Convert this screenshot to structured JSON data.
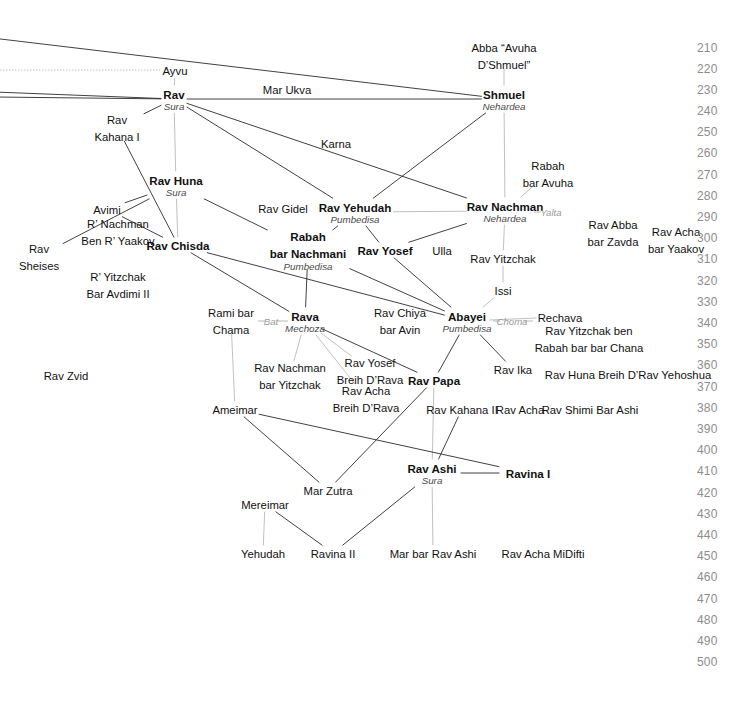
{
  "diagram": {
    "colors": {
      "line": "#2b2b2b",
      "line_light": "#b0b0b0",
      "year_text": "#8d8d8d",
      "place_text": "#4a4a4a",
      "relation_text": "#9a9a9a",
      "background": "#ffffff"
    },
    "timeline": {
      "label": "Years (CE)",
      "ticks": [
        {
          "year": "210",
          "y": 48
        },
        {
          "year": "220",
          "y": 69
        },
        {
          "year": "230",
          "y": 90
        },
        {
          "year": "240",
          "y": 111
        },
        {
          "year": "250",
          "y": 132
        },
        {
          "year": "260",
          "y": 153
        },
        {
          "year": "270",
          "y": 175
        },
        {
          "year": "280",
          "y": 196
        },
        {
          "year": "290",
          "y": 217
        },
        {
          "year": "300",
          "y": 238
        },
        {
          "year": "310",
          "y": 259
        },
        {
          "year": "320",
          "y": 281
        },
        {
          "year": "330",
          "y": 302
        },
        {
          "year": "340",
          "y": 323
        },
        {
          "year": "350",
          "y": 344
        },
        {
          "year": "360",
          "y": 365
        },
        {
          "year": "370",
          "y": 387
        },
        {
          "year": "380",
          "y": 408
        },
        {
          "year": "390",
          "y": 429
        },
        {
          "year": "400",
          "y": 450
        },
        {
          "year": "410",
          "y": 471
        },
        {
          "year": "420",
          "y": 493
        },
        {
          "year": "430",
          "y": 514
        },
        {
          "year": "440",
          "y": 535
        },
        {
          "year": "450",
          "y": 556
        },
        {
          "year": "460",
          "y": 577
        },
        {
          "year": "470",
          "y": 599
        },
        {
          "year": "480",
          "y": 620
        },
        {
          "year": "490",
          "y": 641
        },
        {
          "year": "500",
          "y": 662
        }
      ]
    },
    "nodes": [
      {
        "id": "abba",
        "name": "Abba “Avuha\nD’Shmuel”",
        "place": "",
        "bold": false,
        "x": 504,
        "y": 55
      },
      {
        "id": "ayvu",
        "name": "Ayvu",
        "place": "",
        "bold": false,
        "x": 175,
        "y": 70
      },
      {
        "id": "rav",
        "name": "Rav",
        "place": "Sura",
        "bold": true,
        "x": 174,
        "y": 99
      },
      {
        "id": "shmuel",
        "name": "Shmuel",
        "place": "Nehardea",
        "bold": true,
        "x": 504,
        "y": 99
      },
      {
        "id": "marukva",
        "name": "Mar Ukva",
        "place": "",
        "bold": false,
        "x": 287,
        "y": 89
      },
      {
        "id": "kahana1",
        "name": "Rav\nKahana I",
        "place": "",
        "bold": false,
        "x": 117,
        "y": 127
      },
      {
        "id": "karna",
        "name": "Karna",
        "place": "",
        "bold": false,
        "x": 336,
        "y": 143
      },
      {
        "id": "rabahbaravuha",
        "name": "Rabah\nbar Avuha",
        "place": "",
        "bold": false,
        "x": 548,
        "y": 173
      },
      {
        "id": "ravhuna",
        "name": "Rav Huna",
        "place": "Sura",
        "bold": true,
        "x": 176,
        "y": 185
      },
      {
        "id": "ravgidel",
        "name": "Rav Gidel",
        "place": "",
        "bold": false,
        "x": 283,
        "y": 208
      },
      {
        "id": "ravyehudah",
        "name": "Rav Yehudah",
        "place": "Pumbedisa",
        "bold": true,
        "x": 355,
        "y": 212
      },
      {
        "id": "ravnachman",
        "name": "Rav Nachman",
        "place": "Nehardea",
        "bold": true,
        "x": 505,
        "y": 211
      },
      {
        "id": "avimi",
        "name": "Avimi",
        "place": "",
        "bold": false,
        "x": 107,
        "y": 209
      },
      {
        "id": "ravabba",
        "name": "Rav Abba\nbar Zavda",
        "place": "",
        "bold": false,
        "x": 613,
        "y": 232
      },
      {
        "id": "ravachayaakov",
        "name": "Rav Acha\nbar Yaakov",
        "place": "",
        "bold": false,
        "x": 676,
        "y": 239
      },
      {
        "id": "rnachmanyaakov",
        "name": "R’ Nachman\nBen R’ Yaakov",
        "place": "",
        "bold": false,
        "x": 118,
        "y": 231
      },
      {
        "id": "ravchisda",
        "name": "Rav Chisda",
        "place": "",
        "bold": true,
        "x": 178,
        "y": 245
      },
      {
        "id": "rabah",
        "name": "Rabah\nbar Nachmani",
        "place": "Pumbedisa",
        "bold": true,
        "x": 308,
        "y": 250
      },
      {
        "id": "ravyosef",
        "name": "Rav Yosef",
        "place": "",
        "bold": true,
        "x": 385,
        "y": 250
      },
      {
        "id": "ulla",
        "name": "Ulla",
        "place": "",
        "bold": false,
        "x": 442,
        "y": 250
      },
      {
        "id": "ravyitzchak",
        "name": "Rav Yitzchak",
        "place": "",
        "bold": false,
        "x": 503,
        "y": 258
      },
      {
        "id": "ravsheises",
        "name": "Rav\nSheises",
        "place": "",
        "bold": false,
        "x": 39,
        "y": 256
      },
      {
        "id": "ryitzchakavd",
        "name": "R’ Yitzchak\nBar Avdimi II",
        "place": "",
        "bold": false,
        "x": 118,
        "y": 284
      },
      {
        "id": "issi",
        "name": "Issi",
        "place": "",
        "bold": false,
        "x": 503,
        "y": 290
      },
      {
        "id": "ramibarchama",
        "name": "Rami bar\nChama",
        "place": "",
        "bold": false,
        "x": 231,
        "y": 320
      },
      {
        "id": "rava",
        "name": "Rava",
        "place": "Mechoza",
        "bold": true,
        "x": 305,
        "y": 321
      },
      {
        "id": "ravchiya",
        "name": "Rav Chiya\nbar Avin",
        "place": "",
        "bold": false,
        "x": 400,
        "y": 320
      },
      {
        "id": "abayei",
        "name": "Abayei",
        "place": "Pumbedisa",
        "bold": true,
        "x": 467,
        "y": 321
      },
      {
        "id": "rechava",
        "name": "Rechava",
        "place": "",
        "bold": false,
        "x": 560,
        "y": 317
      },
      {
        "id": "ravyitzrabah",
        "name": "Rav Yitzchak ben\nRabah bar bar Chana",
        "place": "",
        "bold": false,
        "x": 589,
        "y": 338
      },
      {
        "id": "ravzvid",
        "name": "Rav Zvid",
        "place": "",
        "bold": false,
        "x": 66,
        "y": 375
      },
      {
        "id": "ravnachmanyitz",
        "name": "Rav Nachman\nbar Yitzchak",
        "place": "",
        "bold": false,
        "x": 290,
        "y": 375
      },
      {
        "id": "ravyosefbreih",
        "name": "Rav Yosef\nBreih D’Rava",
        "place": "",
        "bold": false,
        "x": 370,
        "y": 370
      },
      {
        "id": "ravachabreih",
        "name": "Rav Acha\nBreih D’Rava",
        "place": "",
        "bold": false,
        "x": 366,
        "y": 398
      },
      {
        "id": "ravika",
        "name": "Rav Ika",
        "place": "",
        "bold": false,
        "x": 513,
        "y": 369
      },
      {
        "id": "ravhunabreih",
        "name": "Rav Huna Breih D’Rav Yehoshua",
        "place": "",
        "bold": false,
        "x": 628,
        "y": 374
      },
      {
        "id": "ravpapa",
        "name": "Rav Papa",
        "place": "",
        "bold": true,
        "x": 434,
        "y": 380
      },
      {
        "id": "ameimar",
        "name": "Ameimar",
        "place": "",
        "bold": false,
        "x": 235,
        "y": 409
      },
      {
        "id": "ravkahana2",
        "name": "Rav Kahana II",
        "place": "",
        "bold": false,
        "x": 462,
        "y": 409
      },
      {
        "id": "ravacha",
        "name": "Rav Acha",
        "place": "",
        "bold": false,
        "x": 520,
        "y": 409
      },
      {
        "id": "ravshimi",
        "name": "Rav Shimi Bar Ashi",
        "place": "",
        "bold": false,
        "x": 590,
        "y": 409
      },
      {
        "id": "marzutra",
        "name": "Mar Zutra",
        "place": "",
        "bold": false,
        "x": 328,
        "y": 490
      },
      {
        "id": "ravashi",
        "name": "Rav Ashi",
        "place": "Sura",
        "bold": true,
        "x": 432,
        "y": 473
      },
      {
        "id": "ravina1",
        "name": "Ravina I",
        "place": "",
        "bold": true,
        "x": 528,
        "y": 473
      },
      {
        "id": "mereimar",
        "name": "Mereimar",
        "place": "",
        "bold": false,
        "x": 265,
        "y": 504
      },
      {
        "id": "yehudah",
        "name": "Yehudah",
        "place": "",
        "bold": false,
        "x": 263,
        "y": 553
      },
      {
        "id": "ravina2",
        "name": "Ravina II",
        "place": "",
        "bold": false,
        "x": 333,
        "y": 553
      },
      {
        "id": "marbarravashi",
        "name": "Mar bar Rav Ashi",
        "place": "",
        "bold": false,
        "x": 433,
        "y": 553
      },
      {
        "id": "ravachamidifti",
        "name": "Rav Acha MiDifti",
        "place": "",
        "bold": false,
        "x": 543,
        "y": 553
      }
    ],
    "relation_labels": [
      {
        "id": "yalta",
        "text": "Yalta",
        "x": 551,
        "y": 212
      },
      {
        "id": "choma",
        "text": "Choma",
        "x": 512,
        "y": 321
      },
      {
        "id": "bat",
        "text": "Bat",
        "x": 271,
        "y": 321
      }
    ],
    "edges": [
      {
        "from": "top-left-a",
        "to": "shmuel",
        "style": "dark"
      },
      {
        "from": "left-edge-b",
        "to": "rav",
        "style": "dark"
      },
      {
        "from": "left-edge-c",
        "to": "rav",
        "style": "dark"
      },
      {
        "from": "left-edge-d",
        "to": "ayvu",
        "style": "dotted-light"
      },
      {
        "from": "ayvu",
        "to": "rav",
        "style": "light"
      },
      {
        "from": "abba",
        "to": "shmuel",
        "style": "light"
      },
      {
        "from": "rav",
        "to": "shmuel",
        "style": "dark"
      },
      {
        "from": "rav",
        "to": "kahana1",
        "style": "dark"
      },
      {
        "from": "rav",
        "to": "ravhuna",
        "style": "light"
      },
      {
        "from": "rav",
        "to": "ravyehudah",
        "style": "dark"
      },
      {
        "from": "rav",
        "to": "ravnachman",
        "style": "dark"
      },
      {
        "from": "shmuel",
        "to": "ravyehudah",
        "style": "dark"
      },
      {
        "from": "shmuel",
        "to": "ravnachman",
        "style": "light"
      },
      {
        "from": "kahana1",
        "to": "ravchisda",
        "style": "dark"
      },
      {
        "from": "ravhuna",
        "to": "ravchisda",
        "style": "light"
      },
      {
        "from": "ravhuna",
        "to": "avimi",
        "style": "dark"
      },
      {
        "from": "ravhuna",
        "to": "ravsheises",
        "style": "dark"
      },
      {
        "from": "ravhuna",
        "to": "rabah",
        "style": "dark"
      },
      {
        "from": "avimi",
        "to": "ravchisda",
        "style": "dark"
      },
      {
        "from": "rabahbaravuha",
        "to": "ravnachman",
        "style": "light"
      },
      {
        "from": "ravyehudah",
        "to": "ravnachman",
        "style": "light"
      },
      {
        "from": "ravyehudah",
        "to": "ravyosef",
        "style": "dark"
      },
      {
        "from": "ravyehudah",
        "to": "rabah",
        "style": "dark"
      },
      {
        "from": "ravnachman",
        "to": "ravyitzchak",
        "style": "light"
      },
      {
        "from": "ravnachman",
        "to": "ravyosef",
        "style": "dark"
      },
      {
        "from": "ravchisda",
        "to": "rava",
        "style": "dark"
      },
      {
        "from": "ravchisda",
        "to": "abayei",
        "style": "dark"
      },
      {
        "from": "rabah",
        "to": "rava",
        "style": "dark"
      },
      {
        "from": "rabah",
        "to": "abayei",
        "style": "dark"
      },
      {
        "from": "ravyosef",
        "to": "abayei",
        "style": "dark"
      },
      {
        "from": "ravyitzchak",
        "to": "issi",
        "style": "light"
      },
      {
        "from": "issi",
        "to": "abayei",
        "style": "light"
      },
      {
        "from": "abayei",
        "to": "rechava",
        "style": "light"
      },
      {
        "from": "abayei",
        "to": "ravpapa",
        "style": "dark"
      },
      {
        "from": "abayei",
        "to": "ravika",
        "style": "dark"
      },
      {
        "from": "ramibarchama",
        "to": "ameimar",
        "style": "light"
      },
      {
        "from": "rava",
        "to": "ravnachmanyitz",
        "style": "light"
      },
      {
        "from": "rava",
        "to": "ravyosefbreih",
        "style": "light"
      },
      {
        "from": "rava",
        "to": "ravachabreih",
        "style": "light"
      },
      {
        "from": "rava",
        "to": "ravpapa",
        "style": "dark"
      },
      {
        "from": "ravpapa",
        "to": "ravashi",
        "style": "light"
      },
      {
        "from": "ravpapa",
        "to": "marzutra",
        "style": "dark"
      },
      {
        "from": "ravkahana2",
        "to": "ravashi",
        "style": "dark"
      },
      {
        "from": "ameimar",
        "to": "marzutra",
        "style": "dark"
      },
      {
        "from": "ameimar",
        "to": "ravina1",
        "style": "dark"
      },
      {
        "from": "ravashi",
        "to": "ravina1",
        "style": "dark"
      },
      {
        "from": "ravashi",
        "to": "ravina2",
        "style": "dark"
      },
      {
        "from": "ravashi",
        "to": "marbarravashi",
        "style": "light"
      },
      {
        "from": "mereimar",
        "to": "yehudah",
        "style": "light"
      },
      {
        "from": "mereimar",
        "to": "ravina2",
        "style": "dark"
      }
    ]
  }
}
